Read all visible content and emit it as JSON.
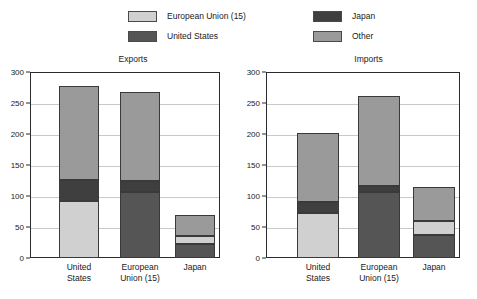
{
  "legend": {
    "columns": [
      {
        "name": "legend-column-left",
        "items": [
          {
            "label": "European Union (15)",
            "color": "#d0d0d0",
            "key": "eu"
          },
          {
            "label": "United States",
            "color": "#555555",
            "key": "us"
          }
        ]
      },
      {
        "name": "legend-column-right",
        "items": [
          {
            "label": "Japan",
            "color": "#3f3f3f",
            "key": "jp"
          },
          {
            "label": "Other",
            "color": "#9a9a9a",
            "key": "other"
          }
        ]
      }
    ]
  },
  "colors": {
    "european_union": "#d0d0d0",
    "united_states": "#555555",
    "japan": "#3f3f3f",
    "other": "#9a9a9a",
    "frame": "#2b2b2b",
    "gridline": "#c9c9c9",
    "text": "#1a1a1a"
  },
  "chart_data": [
    {
      "type": "bar",
      "subtype": "stacked",
      "title": "Exports",
      "xlabel": "",
      "ylabel": "",
      "ylim": [
        0,
        300
      ],
      "yticks": [
        0,
        50,
        100,
        150,
        200,
        250,
        300
      ],
      "grid": true,
      "legend_position": "top",
      "categories": [
        "United States",
        "European Union (15)",
        "Japan"
      ],
      "series": [
        {
          "name": "European Union (15)",
          "values": [
            92,
            0,
            12
          ]
        },
        {
          "name": "United States",
          "values": [
            0,
            106,
            23
          ]
        },
        {
          "name": "Japan",
          "values": [
            34,
            18,
            0
          ]
        },
        {
          "name": "Other",
          "values": [
            151,
            143,
            34
          ]
        }
      ],
      "stack_order": {
        "United States": [
          "European Union (15)",
          "Japan",
          "Other"
        ],
        "European Union (15)": [
          "United States",
          "Japan",
          "Other"
        ],
        "Japan": [
          "United States",
          "European Union (15)",
          "Other"
        ]
      },
      "totals": [
        277,
        267,
        69
      ]
    },
    {
      "type": "bar",
      "subtype": "stacked",
      "title": "Imports",
      "xlabel": "",
      "ylabel": "",
      "ylim": [
        0,
        300
      ],
      "yticks": [
        0,
        50,
        100,
        150,
        200,
        250,
        300
      ],
      "grid": true,
      "legend_position": "top",
      "categories": [
        "United States",
        "European Union (15)",
        "Japan"
      ],
      "series": [
        {
          "name": "European Union (15)",
          "values": [
            73,
            0,
            23
          ]
        },
        {
          "name": "United States",
          "values": [
            0,
            106,
            37
          ]
        },
        {
          "name": "Japan",
          "values": [
            17,
            10,
            0
          ]
        },
        {
          "name": "Other",
          "values": [
            111,
            145,
            54
          ]
        }
      ],
      "stack_order": {
        "United States": [
          "European Union (15)",
          "Japan",
          "Other"
        ],
        "European Union (15)": [
          "United States",
          "Japan",
          "Other"
        ],
        "Japan": [
          "United States",
          "European Union (15)",
          "Other"
        ]
      },
      "totals": [
        201,
        261,
        114
      ]
    }
  ]
}
